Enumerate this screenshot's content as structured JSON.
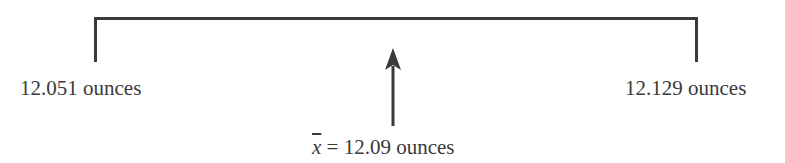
{
  "diagram": {
    "lower_bound_label": "12.051 ounces",
    "upper_bound_label": "12.129 ounces",
    "mean_symbol": "x",
    "mean_equals": " = ",
    "mean_value_label": "12.09 ounces",
    "line_color": "#3a3a3a"
  }
}
